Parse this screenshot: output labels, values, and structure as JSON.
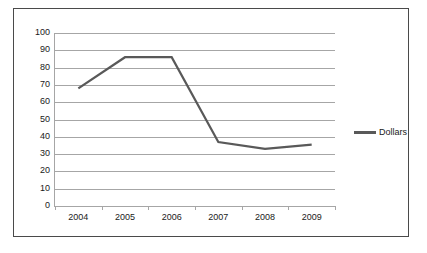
{
  "chart_data": {
    "type": "line",
    "title": "",
    "xlabel": "",
    "ylabel": "",
    "categories": [
      "2004",
      "2005",
      "2006",
      "2007",
      "2008",
      "2009"
    ],
    "series": [
      {
        "name": "Dollars",
        "values": [
          68,
          86,
          86,
          37,
          33,
          35.5
        ],
        "color": "#595959"
      }
    ],
    "ylim": [
      0,
      100
    ],
    "ytick_labels": [
      "100",
      "90",
      "80",
      "70",
      "60",
      "50",
      "40",
      "30",
      "20",
      "10",
      "0"
    ],
    "ytick_values": [
      100,
      90,
      80,
      70,
      60,
      50,
      40,
      30,
      20,
      10,
      0
    ],
    "grid": true,
    "grid_color": "#a6a6a6",
    "legend_position": "right",
    "legend_entries": [
      "Dollars"
    ],
    "border_color": "#4a4a4a",
    "background": "#ffffff"
  }
}
